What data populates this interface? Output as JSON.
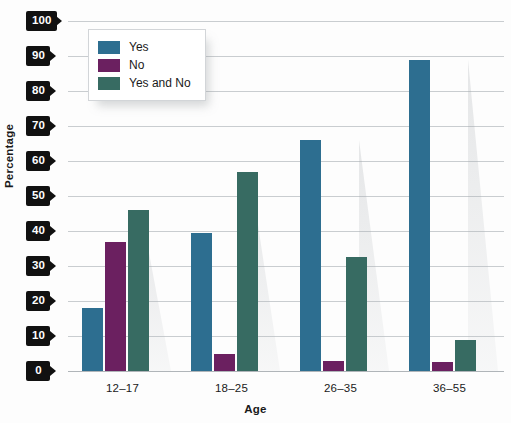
{
  "chart_data": {
    "type": "bar",
    "title": "",
    "subtitle": "",
    "xlabel": "Age",
    "ylabel": "Percentage",
    "categories": [
      "12–17",
      "18–25",
      "26–35",
      "36–55"
    ],
    "series": [
      {
        "name": "Yes",
        "color": "#2d6e90",
        "values": [
          18,
          39.5,
          66,
          89
        ]
      },
      {
        "name": "No",
        "color": "#6b2060",
        "values": [
          37,
          5,
          3,
          2.5
        ]
      },
      {
        "name": "Yes and No",
        "color": "#376b62",
        "values": [
          46,
          57,
          32.5,
          9
        ]
      }
    ],
    "ylim": [
      0,
      100
    ],
    "ytick_step": 10,
    "yticks": [
      "100",
      "90",
      "80",
      "70",
      "60",
      "50",
      "40",
      "30",
      "20",
      "10",
      "0"
    ],
    "grid": true,
    "legend_position": "top-left",
    "axis_label_style": "black-tag"
  },
  "colors": {
    "gridline": "#c9cdd0",
    "axis_tag_bg": "#111111",
    "axis_tag_text": "#ffffff",
    "background": "#fdfdfd",
    "text": "#1a1a1a"
  }
}
